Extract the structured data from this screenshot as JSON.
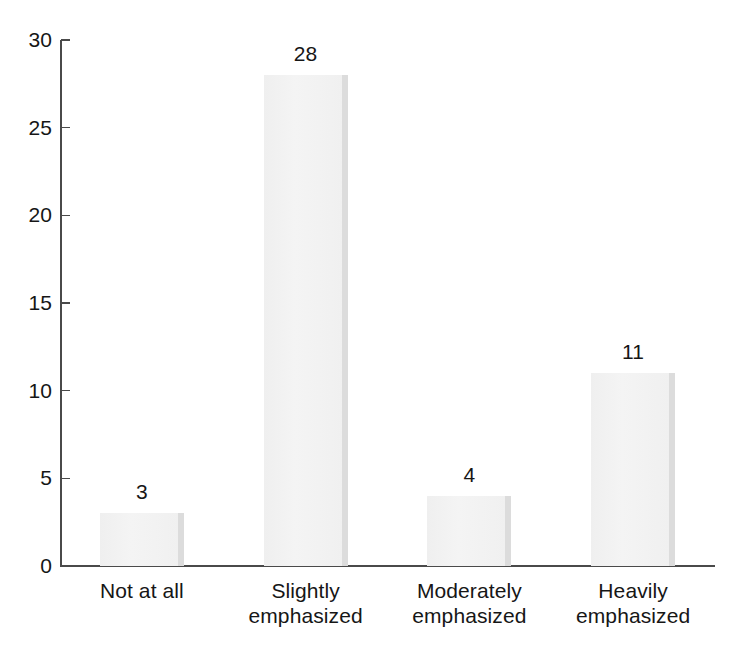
{
  "chart_data": {
    "type": "bar",
    "title": "",
    "subtitle": "",
    "xlabel": "",
    "ylabel": "",
    "categories": [
      "Not at all",
      "Slightly emphasized",
      "Moderately emphasized",
      "Heavily emphasized"
    ],
    "category_lines": [
      [
        "Not at all"
      ],
      [
        "Slightly",
        "emphasized"
      ],
      [
        "Moderately",
        "emphasized"
      ],
      [
        "Heavily",
        "emphasized"
      ]
    ],
    "values": [
      3,
      28,
      4,
      11
    ],
    "value_labels": [
      "3",
      "28",
      "4",
      "11"
    ],
    "ylim": [
      0,
      30
    ],
    "y_ticks": [
      0,
      5,
      10,
      15,
      20,
      25,
      30
    ],
    "y_tick_labels": [
      "0",
      "5",
      "10",
      "15",
      "20",
      "25",
      "30"
    ],
    "grid": false,
    "legend": false,
    "legend_position": "none",
    "annotations": []
  },
  "style": {
    "background": "#ffffff",
    "bar_fill": "#f1f1f1",
    "bar_edge_shadow": "#dcdcdc",
    "axis_color": "#4a4a4a",
    "text_color": "#161616"
  }
}
